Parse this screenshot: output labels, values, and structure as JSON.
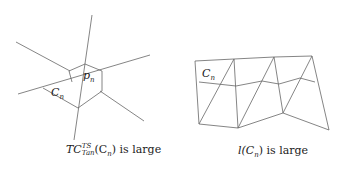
{
  "left_figure": {
    "label_point": "p",
    "label_point_sub": "n",
    "label_curve": "C",
    "label_curve_sub": "n",
    "caption": {
      "pre": "TC",
      "sup": "TS",
      "sub": "Tan",
      "arg": "(C",
      "arg_sub": "n",
      "post": ") is large"
    }
  },
  "right_figure": {
    "label_curve": "C",
    "label_curve_sub": "n",
    "caption": {
      "pre": "l(C",
      "pre_sub": "n",
      "post": ") is large"
    }
  },
  "colors": {
    "line": "#555555",
    "text": "#222222"
  }
}
